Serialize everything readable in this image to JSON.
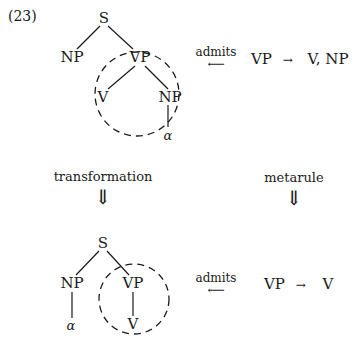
{
  "example_number": "(23)",
  "top_tree": {
    "root": "S",
    "np": "NP",
    "vp": "VP",
    "v": "V",
    "np_obj": "NP",
    "alpha": "α"
  },
  "top_relation": {
    "label": "admits",
    "arrow": "⟵",
    "rule_lhs": "VP",
    "rule_arrow": "→",
    "rule_rhs": "V, NP"
  },
  "transformation": {
    "label": "transformation",
    "arrow": "⇓"
  },
  "metarule": {
    "label": "metarule",
    "arrow": "⇓"
  },
  "bottom_tree": {
    "root": "S",
    "np": "NP",
    "vp": "VP",
    "v": "V",
    "alpha": "α"
  },
  "bottom_relation": {
    "label": "admits",
    "arrow": "⟵",
    "rule_lhs": "VP",
    "rule_arrow": "→",
    "rule_rhs": "V"
  }
}
